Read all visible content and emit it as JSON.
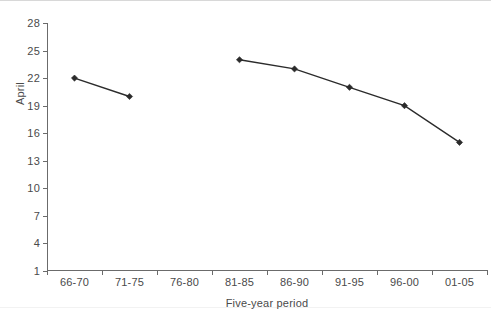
{
  "chart_data": {
    "type": "line",
    "title": "",
    "xlabel": "Five-year period",
    "ylabel": "April",
    "categories": [
      "66-70",
      "71-75",
      "76-80",
      "81-85",
      "86-90",
      "91-95",
      "96-00",
      "01-05"
    ],
    "values": [
      22,
      20,
      null,
      24,
      23,
      21,
      19,
      15
    ],
    "series": [
      {
        "name": "April",
        "values": [
          22,
          20,
          null,
          24,
          23,
          21,
          19,
          15
        ]
      }
    ],
    "ylim": [
      1,
      28
    ],
    "yticks": [
      1,
      4,
      7,
      10,
      13,
      16,
      19,
      22,
      25,
      28
    ],
    "ytick_labels": [
      "1",
      "4",
      "7",
      "10",
      "13",
      "16",
      "19",
      "22",
      "25",
      "28"
    ],
    "grid": false,
    "legend": null,
    "marker": "diamond",
    "line_color": "#2b2b2b",
    "text_color": "#4a4a4a",
    "axis_color": "#6b6b6b",
    "background": "#ffffff"
  }
}
